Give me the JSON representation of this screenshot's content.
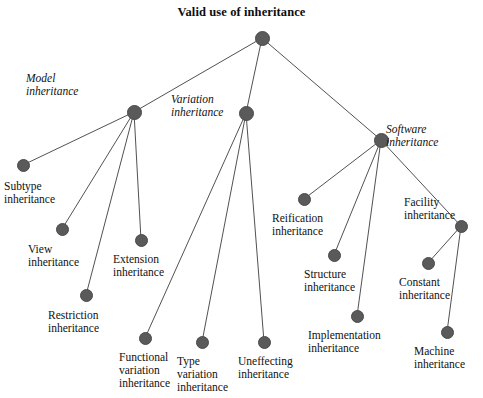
{
  "title": "Valid use of inheritance",
  "colors": {
    "node_fill": "#5a5a5a",
    "node_stroke": "#4a4a4a",
    "edge": "#3d3d3d",
    "text": "#111111",
    "background": "#ffffff"
  },
  "chart_data": {
    "type": "diagram",
    "title": "Valid use of inheritance",
    "layout": "node-link tree, top-down",
    "nodes": [
      {
        "id": "root",
        "label": "",
        "x": 262,
        "y": 38,
        "r": 7.5,
        "style": "normal"
      },
      {
        "id": "model",
        "label": "Model\ninheritance",
        "x": 134,
        "y": 112,
        "r": 7.5,
        "style": "italic"
      },
      {
        "id": "variation",
        "label": "Variation\ninheritance",
        "x": 246,
        "y": 113,
        "r": 7.5,
        "style": "italic"
      },
      {
        "id": "software",
        "label": "Software\ninheritance",
        "x": 381,
        "y": 140,
        "r": 7.5,
        "style": "italic"
      },
      {
        "id": "subtype",
        "label": "Subtype\ninheritance",
        "x": 23,
        "y": 165,
        "r": 6.5,
        "style": "normal"
      },
      {
        "id": "view",
        "label": "View\ninheritance",
        "x": 62,
        "y": 229,
        "r": 6.5,
        "style": "normal"
      },
      {
        "id": "extension",
        "label": "Extension\ninheritance",
        "x": 141,
        "y": 240,
        "r": 6.5,
        "style": "normal"
      },
      {
        "id": "restriction",
        "label": "Restriction\ninheritance",
        "x": 86,
        "y": 295,
        "r": 6.5,
        "style": "normal"
      },
      {
        "id": "functional",
        "label": "Functional\nvariation\ninheritance",
        "x": 145,
        "y": 338,
        "r": 6.5,
        "style": "normal"
      },
      {
        "id": "type",
        "label": "Type\nvariation\ninheritance",
        "x": 202,
        "y": 342,
        "r": 6.5,
        "style": "normal"
      },
      {
        "id": "uneffecting",
        "label": "Uneffecting\ninheritance",
        "x": 264,
        "y": 342,
        "r": 6.5,
        "style": "normal"
      },
      {
        "id": "reification",
        "label": "Reification\ninheritance",
        "x": 304,
        "y": 199,
        "r": 6.5,
        "style": "normal"
      },
      {
        "id": "structure",
        "label": "Structure\ninheritance",
        "x": 334,
        "y": 255,
        "r": 6.5,
        "style": "normal"
      },
      {
        "id": "implementation",
        "label": "Implementation\ninheritance",
        "x": 357,
        "y": 316,
        "r": 6.5,
        "style": "normal"
      },
      {
        "id": "facility",
        "label": "Facility\ninheritance",
        "x": 461,
        "y": 226,
        "r": 6.5,
        "style": "normal"
      },
      {
        "id": "constant",
        "label": "Constant\ninheritance",
        "x": 428,
        "y": 263,
        "r": 6.5,
        "style": "normal"
      },
      {
        "id": "machine",
        "label": "Machine\ninheritance",
        "x": 447,
        "y": 332,
        "r": 6.5,
        "style": "normal"
      }
    ],
    "edges": [
      {
        "from": "root",
        "to": "model"
      },
      {
        "from": "root",
        "to": "variation"
      },
      {
        "from": "root",
        "to": "software"
      },
      {
        "from": "model",
        "to": "subtype"
      },
      {
        "from": "model",
        "to": "view"
      },
      {
        "from": "model",
        "to": "restriction"
      },
      {
        "from": "model",
        "to": "extension"
      },
      {
        "from": "variation",
        "to": "functional"
      },
      {
        "from": "variation",
        "to": "type"
      },
      {
        "from": "variation",
        "to": "uneffecting"
      },
      {
        "from": "software",
        "to": "reification"
      },
      {
        "from": "software",
        "to": "structure"
      },
      {
        "from": "software",
        "to": "implementation"
      },
      {
        "from": "software",
        "to": "facility"
      },
      {
        "from": "facility",
        "to": "constant"
      },
      {
        "from": "facility",
        "to": "machine"
      }
    ],
    "labels": [
      {
        "id": "model",
        "text": "Model\ninheritance",
        "x": 26,
        "y": 72,
        "align": "left",
        "italic": true
      },
      {
        "id": "variation",
        "text": "Variation\ninheritance",
        "x": 171,
        "y": 93,
        "align": "left",
        "italic": true
      },
      {
        "id": "software",
        "text": "Software\ninheritance",
        "x": 386,
        "y": 123,
        "align": "left",
        "italic": true
      },
      {
        "id": "subtype",
        "text": "Subtype\ninheritance",
        "x": 4,
        "y": 180,
        "align": "left",
        "italic": false
      },
      {
        "id": "view",
        "text": "View\ninheritance",
        "x": 28,
        "y": 243,
        "align": "left",
        "italic": false
      },
      {
        "id": "extension",
        "text": "Extension\ninheritance",
        "x": 113,
        "y": 253,
        "align": "left",
        "italic": false
      },
      {
        "id": "restriction",
        "text": "Restriction\ninheritance",
        "x": 48,
        "y": 309,
        "align": "left",
        "italic": false
      },
      {
        "id": "functional",
        "text": "Functional\nvariation\ninheritance",
        "x": 119,
        "y": 351,
        "align": "left",
        "italic": false
      },
      {
        "id": "type",
        "text": "Type\nvariation\ninheritance",
        "x": 177,
        "y": 355,
        "align": "left",
        "italic": false
      },
      {
        "id": "uneffecting",
        "text": "Uneffecting\ninheritance",
        "x": 238,
        "y": 355,
        "align": "left",
        "italic": false
      },
      {
        "id": "reification",
        "text": "Reification\ninheritance",
        "x": 272,
        "y": 212,
        "align": "left",
        "italic": false
      },
      {
        "id": "structure",
        "text": "Structure\ninheritance",
        "x": 304,
        "y": 268,
        "align": "left",
        "italic": false
      },
      {
        "id": "implementation",
        "text": "Implementation\ninheritance",
        "x": 308,
        "y": 329,
        "align": "left",
        "italic": false
      },
      {
        "id": "facility",
        "text": "Facility\ninheritance",
        "x": 404,
        "y": 196,
        "align": "left",
        "italic": false
      },
      {
        "id": "constant",
        "text": "Constant\ninheritance",
        "x": 399,
        "y": 276,
        "align": "left",
        "italic": false
      },
      {
        "id": "machine",
        "text": "Machine\ninheritance",
        "x": 414,
        "y": 345,
        "align": "left",
        "italic": false
      }
    ]
  }
}
